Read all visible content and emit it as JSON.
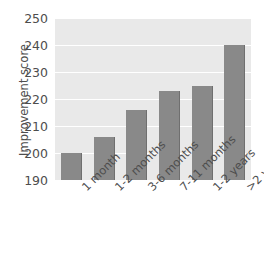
{
  "chart_data": {
    "type": "bar",
    "title": "",
    "xlabel": "",
    "ylabel": "Improvement score",
    "categories": [
      "1 month",
      "1-2 months",
      "3-6 months",
      "7-11 months",
      "1-2 years",
      ">2 years"
    ],
    "values": [
      200,
      206,
      216,
      223,
      225,
      240
    ],
    "ylim": [
      190,
      250
    ],
    "yticks": [
      190,
      200,
      210,
      220,
      230,
      240,
      250
    ],
    "grid": true,
    "legend": "none",
    "bar_color": "#898989",
    "plot_background": "#e9e9e9",
    "gridline_color": "#ffffff",
    "text_color": "#4d4d4d"
  }
}
